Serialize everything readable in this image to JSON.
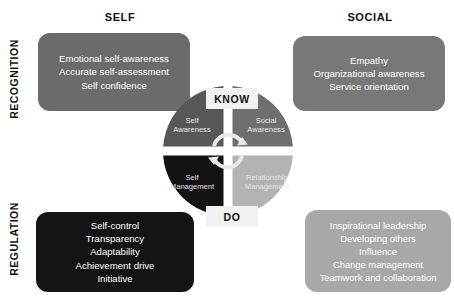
{
  "diagram": {
    "column_headers": {
      "self": "SELF",
      "social": "SOCIAL"
    },
    "row_labels": {
      "recognition": "RECOGNITION",
      "regulation": "REGULATION"
    },
    "center": {
      "know": "KNOW",
      "do": "DO",
      "cycle_icon": "circular-arrow-icon"
    },
    "quadrants": [
      {
        "id": "self-awareness",
        "label_line1": "Self",
        "label_line2": "Awareness",
        "color": "#575757",
        "position": "top-left"
      },
      {
        "id": "social-awareness",
        "label_line1": "Social",
        "label_line2": "Awareness",
        "color": "#6f6f6f",
        "position": "top-right"
      },
      {
        "id": "self-management",
        "label_line1": "Self",
        "label_line2": "Management",
        "color": "#131313",
        "position": "bottom-left"
      },
      {
        "id": "relationship-management",
        "label_line1": "Relationship",
        "label_line2": "Management",
        "color": "#b3b3b3",
        "position": "bottom-right"
      }
    ],
    "competency_boxes": [
      {
        "id": "self-awareness-box",
        "quadrant": "recognition-self",
        "color": "#6b6b6b",
        "items": [
          "Emotional self-awareness",
          "Accurate self-assessment",
          "Self confidence"
        ]
      },
      {
        "id": "social-awareness-box",
        "quadrant": "recognition-social",
        "color": "#787878",
        "items": [
          "Empathy",
          "Organizational awareness",
          "Service orientation"
        ]
      },
      {
        "id": "self-management-box",
        "quadrant": "regulation-self",
        "color": "#141414",
        "items": [
          "Self-control",
          "Transparency",
          "Adaptability",
          "Achievement drive",
          "Initiative"
        ]
      },
      {
        "id": "relationship-management-box",
        "quadrant": "regulation-social",
        "color": "#a8a8a8",
        "items": [
          "Inspirational leadership",
          "Developing others",
          "Influence",
          "Change management",
          "Teamwork and collaboration"
        ]
      }
    ]
  }
}
